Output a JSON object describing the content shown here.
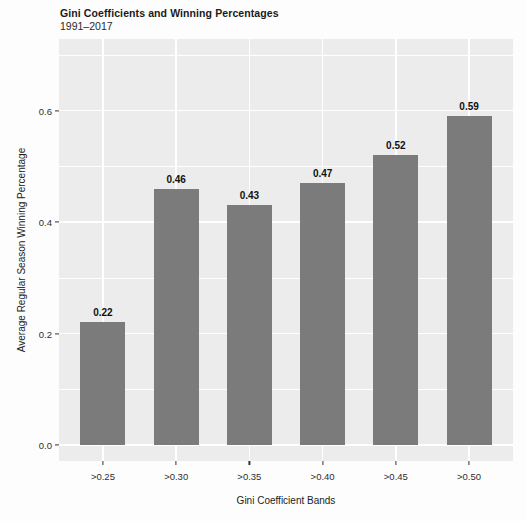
{
  "chart_data": {
    "type": "bar",
    "title": "Gini Coefficients and Winning Percentages",
    "subtitle": "1991–2017",
    "categories": [
      ">0.25",
      ">0.30",
      ">0.35",
      ">0.40",
      ">0.45",
      ">0.50"
    ],
    "values": [
      0.22,
      0.46,
      0.43,
      0.47,
      0.52,
      0.59
    ],
    "bar_labels": [
      "0.22",
      "0.46",
      "0.43",
      "0.47",
      "0.52",
      "0.59"
    ],
    "xlabel": "Gini Coefficient Bands",
    "ylabel": "Average Regular Season Winning Percentage",
    "y_ticks": [
      0.0,
      0.2,
      0.4,
      0.6
    ],
    "y_tick_labels": [
      "0.0",
      "0.2",
      "0.4",
      "0.6"
    ],
    "y_minor_ticks": [
      0.1,
      0.3,
      0.5,
      0.7
    ],
    "ylim": [
      -0.029,
      0.728
    ],
    "grid": true,
    "legend": "none",
    "colors": {
      "bar": "#7b7b7b",
      "panel": "#ececec",
      "gridline": "#ffffff",
      "text": "#1a1a1a",
      "tick_mark": "#333333",
      "background": "#fdfdfd"
    }
  }
}
